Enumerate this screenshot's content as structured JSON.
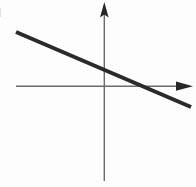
{
  "figure": {
    "title": "Line with negative slope on coordinate axes",
    "background_color": "#fdfdfd",
    "width": 196,
    "height": 187
  },
  "chart_data": {
    "type": "line",
    "title": "Line with negative slope on coordinate axes",
    "subtitle": "",
    "xlabel": "",
    "ylabel": "",
    "grid": false,
    "legend": false,
    "legend_position": "none",
    "axes": {
      "origin_px": {
        "x": 104,
        "y": 86
      },
      "x_axis": {
        "label": "",
        "orientation": "horizontal",
        "start_px": {
          "x": 16,
          "y": 86
        },
        "end_px": {
          "x": 193,
          "y": 86
        },
        "arrow_end": "right",
        "color": "#6b6b6b",
        "thickness_px": 1.4,
        "ticks": [],
        "tick_labels": []
      },
      "y_axis": {
        "label": "",
        "orientation": "vertical",
        "start_px": {
          "x": 104,
          "y": 181
        },
        "end_px": {
          "x": 104,
          "y": 2
        },
        "arrow_end": "top",
        "color": "#6b6b6b",
        "thickness_px": 1.4,
        "ticks": [],
        "tick_labels": []
      }
    },
    "series": [
      {
        "name": "line",
        "color": "#2a2a2a",
        "thickness_px": 4,
        "slope": -0.43,
        "points_px": [
          {
            "x": 16,
            "y": 32
          },
          {
            "x": 191,
            "y": 107
          }
        ],
        "y_intercept_px": {
          "x": 104,
          "y": 71
        },
        "x_intercept_px": {
          "x": 144,
          "y": 86
        },
        "x": [
          -88,
          87
        ],
        "values": [
          54,
          -21
        ]
      }
    ],
    "annotations": [],
    "xlim": [
      -88,
      89
    ],
    "ylim": [
      -95,
      84
    ]
  },
  "elements": {
    "x_axis_arrow_name": "x-axis-arrow-icon",
    "y_axis_arrow_name": "y-axis-arrow-icon",
    "line_name": "negative-slope-line"
  }
}
